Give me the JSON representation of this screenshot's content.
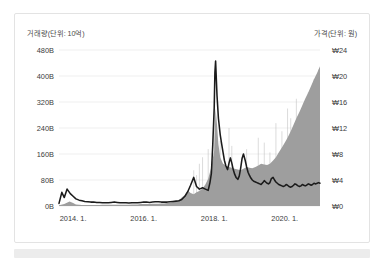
{
  "chart_data": {
    "type": "area",
    "title": "",
    "subtitle": "",
    "left_axis_caption": "거래량(단위: 10억)",
    "right_axis_caption": "가격(단위: 원)",
    "xlabel": "",
    "ylabel": "",
    "grid": true,
    "legend_position": "none",
    "left_axis": {
      "label": "거래량(단위: 10억)",
      "unit": "B",
      "ticks": [
        "480B",
        "400B",
        "320B",
        "240B",
        "160B",
        "80B",
        "0B"
      ],
      "tick_values": [
        480,
        400,
        320,
        240,
        160,
        80,
        0
      ],
      "ylim": [
        0,
        480
      ]
    },
    "right_axis": {
      "label": "가격(단위: 원)",
      "unit": "₩",
      "ticks": [
        "₩24",
        "₩20",
        "₩16",
        "₩12",
        "₩8",
        "₩4",
        "₩0"
      ],
      "tick_values": [
        24,
        20,
        16,
        12,
        8,
        4,
        0
      ],
      "ylim": [
        0,
        24
      ]
    },
    "x_ticks": [
      "2014. 1.",
      "2016. 1.",
      "2018. 1.",
      "2020. 1."
    ],
    "x_tick_values": [
      2014.0,
      2016.0,
      2018.0,
      2020.0
    ],
    "xlim": [
      2013.6,
      2021.0
    ],
    "series": [
      {
        "name": "거래량",
        "type": "area",
        "axis": "left",
        "color": "#9e9e9e",
        "x": [
          2013.6,
          2013.75,
          2013.9,
          2014.0,
          2014.08,
          2014.17,
          2014.25,
          2014.33,
          2014.42,
          2014.5,
          2014.58,
          2014.67,
          2014.75,
          2014.83,
          2014.92,
          2015.0,
          2015.08,
          2015.17,
          2015.25,
          2015.33,
          2015.42,
          2015.5,
          2015.58,
          2015.67,
          2015.75,
          2015.83,
          2015.92,
          2016.0,
          2016.08,
          2016.17,
          2016.25,
          2016.33,
          2016.42,
          2016.5,
          2016.58,
          2016.67,
          2016.75,
          2016.83,
          2016.92,
          2017.0,
          2017.08,
          2017.17,
          2017.25,
          2017.33,
          2017.42,
          2017.5,
          2017.58,
          2017.67,
          2017.75,
          2017.83,
          2017.92,
          2018.0,
          2018.04,
          2018.08,
          2018.12,
          2018.17,
          2018.25,
          2018.33,
          2018.42,
          2018.5,
          2018.58,
          2018.67,
          2018.75,
          2018.83,
          2018.92,
          2019.0,
          2019.08,
          2019.17,
          2019.25,
          2019.33,
          2019.42,
          2019.5,
          2019.58,
          2019.67,
          2019.75,
          2019.83,
          2019.92,
          2020.0,
          2020.08,
          2020.17,
          2020.25,
          2020.33,
          2020.42,
          2020.5,
          2020.58,
          2020.67,
          2020.75,
          2020.83,
          2020.92,
          2021.0
        ],
        "values": [
          2,
          6,
          14,
          9,
          5,
          4,
          3,
          3,
          3,
          3,
          3,
          3,
          3,
          4,
          4,
          4,
          4,
          4,
          4,
          4,
          4,
          4,
          4,
          5,
          5,
          5,
          6,
          6,
          6,
          6,
          7,
          7,
          7,
          8,
          8,
          9,
          10,
          12,
          14,
          18,
          26,
          34,
          48,
          40,
          36,
          42,
          46,
          54,
          66,
          84,
          120,
          170,
          300,
          250,
          190,
          150,
          130,
          125,
          120,
          118,
          115,
          112,
          110,
          115,
          120,
          118,
          116,
          120,
          125,
          130,
          128,
          126,
          130,
          140,
          150,
          165,
          180,
          195,
          210,
          230,
          250,
          270,
          290,
          310,
          330,
          350,
          370,
          390,
          410,
          430
        ]
      },
      {
        "name": "가격",
        "type": "line",
        "axis": "right",
        "color": "#1b1b1b",
        "x": [
          2013.6,
          2013.68,
          2013.75,
          2013.83,
          2013.92,
          2014.0,
          2014.08,
          2014.17,
          2014.25,
          2014.33,
          2014.42,
          2014.5,
          2014.58,
          2014.67,
          2014.75,
          2014.83,
          2014.92,
          2015.0,
          2015.08,
          2015.17,
          2015.25,
          2015.33,
          2015.42,
          2015.5,
          2015.58,
          2015.67,
          2015.75,
          2015.83,
          2015.92,
          2016.0,
          2016.08,
          2016.17,
          2016.25,
          2016.33,
          2016.42,
          2016.5,
          2016.58,
          2016.67,
          2016.75,
          2016.83,
          2016.92,
          2017.0,
          2017.08,
          2017.17,
          2017.25,
          2017.33,
          2017.42,
          2017.5,
          2017.58,
          2017.67,
          2017.75,
          2017.83,
          2017.88,
          2017.92,
          2017.96,
          2018.0,
          2018.02,
          2018.04,
          2018.08,
          2018.12,
          2018.17,
          2018.21,
          2018.25,
          2018.29,
          2018.33,
          2018.38,
          2018.42,
          2018.46,
          2018.5,
          2018.54,
          2018.58,
          2018.62,
          2018.67,
          2018.71,
          2018.75,
          2018.79,
          2018.83,
          2018.88,
          2018.92,
          2018.96,
          2019.0,
          2019.04,
          2019.08,
          2019.12,
          2019.17,
          2019.21,
          2019.25,
          2019.29,
          2019.33,
          2019.38,
          2019.42,
          2019.46,
          2019.5,
          2019.54,
          2019.58,
          2019.62,
          2019.67,
          2019.71,
          2019.75,
          2019.79,
          2019.83,
          2019.88,
          2019.92,
          2019.96,
          2020.0,
          2020.04,
          2020.08,
          2020.12,
          2020.17,
          2020.21,
          2020.25,
          2020.29,
          2020.33,
          2020.38,
          2020.42,
          2020.46,
          2020.5,
          2020.54,
          2020.58,
          2020.62,
          2020.67,
          2020.71,
          2020.75,
          2020.79,
          2020.83,
          2020.88,
          2020.92,
          2020.96,
          2021.0
        ],
        "values": [
          0.4,
          2.1,
          1.3,
          2.6,
          1.9,
          1.5,
          1.1,
          0.9,
          0.8,
          0.7,
          0.65,
          0.6,
          0.6,
          0.55,
          0.55,
          0.5,
          0.5,
          0.5,
          0.55,
          0.6,
          0.55,
          0.5,
          0.5,
          0.5,
          0.45,
          0.5,
          0.5,
          0.5,
          0.55,
          0.6,
          0.6,
          0.55,
          0.6,
          0.65,
          0.65,
          0.6,
          0.6,
          0.6,
          0.65,
          0.7,
          0.75,
          0.8,
          1.0,
          1.5,
          2.2,
          3.2,
          4.4,
          3.0,
          2.6,
          2.8,
          2.6,
          2.4,
          3.6,
          5.0,
          9.5,
          15.0,
          20.5,
          22.3,
          17.0,
          13.5,
          11.0,
          9.6,
          8.3,
          7.0,
          6.2,
          5.6,
          6.6,
          7.4,
          6.6,
          5.6,
          4.9,
          4.4,
          4.1,
          4.6,
          5.8,
          7.3,
          8.0,
          7.0,
          6.0,
          5.2,
          4.7,
          4.3,
          4.0,
          3.8,
          3.7,
          3.6,
          3.5,
          3.4,
          3.3,
          3.6,
          3.9,
          3.7,
          3.5,
          3.4,
          3.6,
          4.2,
          4.4,
          4.0,
          3.7,
          3.5,
          3.3,
          3.2,
          3.1,
          3.0,
          3.1,
          3.3,
          3.2,
          3.0,
          2.9,
          3.0,
          3.2,
          3.4,
          3.3,
          3.1,
          3.0,
          3.1,
          3.3,
          3.2,
          3.1,
          3.2,
          3.4,
          3.3,
          3.2,
          3.3,
          3.5,
          3.4,
          3.5,
          3.6,
          3.5
        ]
      }
    ],
    "volume_spikes": [
      {
        "x": 2017.42,
        "value": 110
      },
      {
        "x": 2017.5,
        "value": 95
      },
      {
        "x": 2017.58,
        "value": 130
      },
      {
        "x": 2017.67,
        "value": 150
      },
      {
        "x": 2017.83,
        "value": 175
      },
      {
        "x": 2018.0,
        "value": 300
      },
      {
        "x": 2018.04,
        "value": 265
      },
      {
        "x": 2018.17,
        "value": 200
      },
      {
        "x": 2018.42,
        "value": 240
      },
      {
        "x": 2018.5,
        "value": 185
      },
      {
        "x": 2018.92,
        "value": 175
      },
      {
        "x": 2019.25,
        "value": 210
      },
      {
        "x": 2019.42,
        "value": 195
      },
      {
        "x": 2019.58,
        "value": 165
      },
      {
        "x": 2019.75,
        "value": 255
      },
      {
        "x": 2019.92,
        "value": 230
      },
      {
        "x": 2020.08,
        "value": 300
      },
      {
        "x": 2020.17,
        "value": 270
      },
      {
        "x": 2020.33,
        "value": 330
      },
      {
        "x": 2020.5,
        "value": 300
      },
      {
        "x": 2020.67,
        "value": 350
      },
      {
        "x": 2020.83,
        "value": 390
      },
      {
        "x": 2020.96,
        "value": 420
      }
    ]
  }
}
